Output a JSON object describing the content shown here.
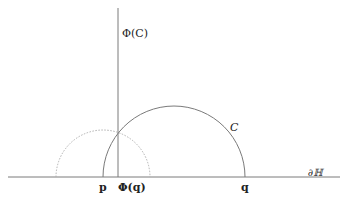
{
  "diagram": {
    "labels": {
      "phi_c": "Φ(C)",
      "c": "C",
      "boundary": "∂ℍ",
      "p": "p",
      "phi_q": "Φ(q)",
      "q": "q"
    },
    "colors": {
      "line": "#7a7a7a",
      "dotted": "#b0b0b0",
      "text": "#222222"
    }
  }
}
